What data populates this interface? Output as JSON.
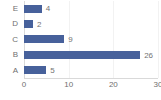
{
  "chart_data": {
    "type": "bar",
    "orientation": "horizontal",
    "title": "",
    "xlabel": "",
    "ylabel": "",
    "categories": [
      "A",
      "B",
      "C",
      "D",
      "E"
    ],
    "values": [
      5,
      26,
      9,
      2,
      4
    ],
    "data_labels": [
      "5",
      "26",
      "9",
      "2",
      "4"
    ],
    "xlim": [
      0,
      30
    ],
    "xticks": [
      0,
      10,
      20,
      30
    ],
    "xtick_labels": [
      "0",
      "10",
      "20",
      "30"
    ],
    "grid": "vertical",
    "legend": "none",
    "series": [
      {
        "name": "",
        "color": "#47619b",
        "values": [
          5,
          26,
          9,
          2,
          4
        ]
      }
    ],
    "colors": {
      "bar": "#47619b",
      "gridline": "#f2f2f2",
      "axis": "#d9d9d9",
      "tick_text": "#6f6f6f",
      "label_text": "#737373",
      "background": "#ffffff"
    }
  }
}
